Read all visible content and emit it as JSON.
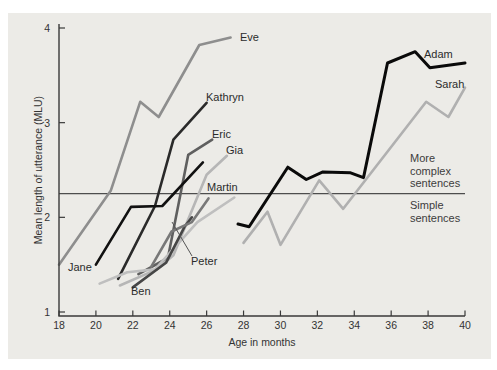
{
  "figure": {
    "panel_background": "#ecebe7",
    "axis_color": "#3a3a3a",
    "text_color": "#333333"
  },
  "chart_data": {
    "type": "line",
    "title": "",
    "xlabel": "Age in months",
    "ylabel": "Mean length of utterance (MLU)",
    "xlim": [
      18,
      40
    ],
    "ylim": [
      1,
      4
    ],
    "x_ticks": [
      18,
      20,
      22,
      24,
      26,
      28,
      30,
      32,
      34,
      36,
      38,
      40
    ],
    "y_ticks": [
      1,
      2,
      3,
      4
    ],
    "grid": false,
    "legend": "inline-labels",
    "divider": {
      "mlu": 2.25,
      "above_label": "More complex sentences",
      "below_label": "Simple sentences"
    },
    "series": [
      {
        "name": "Eve",
        "color": "#8e8e8e",
        "width": 2.6,
        "points": [
          [
            18,
            1.5
          ],
          [
            20.8,
            2.28
          ],
          [
            22.4,
            3.22
          ],
          [
            23.4,
            3.06
          ],
          [
            25.6,
            3.82
          ],
          [
            27.3,
            3.9
          ]
        ],
        "label_px": {
          "x": 240,
          "y": 31
        }
      },
      {
        "name": "Kathryn",
        "color": "#2a2a2a",
        "width": 2.6,
        "points": [
          [
            21.2,
            1.35
          ],
          [
            23.2,
            2.12
          ],
          [
            24.2,
            2.82
          ],
          [
            26,
            3.21
          ]
        ],
        "label_px": {
          "x": 206,
          "y": 91
        }
      },
      {
        "name": "Eric",
        "color": "#5f5f5f",
        "width": 2.6,
        "points": [
          [
            22.3,
            1.4
          ],
          [
            23.9,
            1.57
          ],
          [
            25,
            2.66
          ],
          [
            26.3,
            2.82
          ]
        ],
        "label_px": {
          "x": 212,
          "y": 128
        }
      },
      {
        "name": "Gia",
        "color": "#b6b6b6",
        "width": 2.6,
        "points": [
          [
            21.3,
            1.28
          ],
          [
            23.3,
            1.45
          ],
          [
            24.2,
            1.6
          ],
          [
            26,
            2.45
          ],
          [
            27.1,
            2.65
          ]
        ],
        "label_px": {
          "x": 226,
          "y": 144
        }
      },
      {
        "name": "Martin",
        "color": "#bfbfbf",
        "width": 2.6,
        "points": [
          [
            20.2,
            1.3
          ],
          [
            21.7,
            1.42
          ],
          [
            23.2,
            1.45
          ],
          [
            25.5,
            1.95
          ],
          [
            27.5,
            2.21
          ]
        ],
        "label_px": {
          "x": 207,
          "y": 181
        }
      },
      {
        "name": "Jane",
        "color": "#111111",
        "width": 2.6,
        "points": [
          [
            20,
            1.5
          ],
          [
            21.9,
            2.11
          ],
          [
            23.6,
            2.12
          ],
          [
            25.8,
            2.58
          ]
        ],
        "label_px": {
          "x": 68,
          "y": 261
        }
      },
      {
        "name": "Ben",
        "color": "#464646",
        "width": 2.6,
        "points": [
          [
            22,
            1.26
          ],
          [
            23.8,
            1.52
          ],
          [
            24.8,
            1.9
          ],
          [
            25.2,
            2.0
          ]
        ],
        "label_px": {
          "x": 131,
          "y": 285
        }
      },
      {
        "name": "Peter",
        "color": "#787878",
        "width": 2.6,
        "points": [
          [
            23,
            1.48
          ],
          [
            24.1,
            1.85
          ],
          [
            25.2,
            1.95
          ],
          [
            26.1,
            2.2
          ]
        ],
        "label_px": {
          "x": 191,
          "y": 255
        },
        "callout_px": {
          "x1": 192,
          "y1": 256,
          "x2": 172,
          "y2": 222
        }
      },
      {
        "name": "Adam",
        "color": "#0a0a0a",
        "width": 3,
        "points": [
          [
            27.7,
            1.93
          ],
          [
            28.3,
            1.9
          ],
          [
            30.4,
            2.53
          ],
          [
            31.4,
            2.4
          ],
          [
            32.3,
            2.48
          ],
          [
            33.8,
            2.47
          ],
          [
            34.5,
            2.42
          ],
          [
            35.8,
            3.63
          ],
          [
            37.3,
            3.75
          ],
          [
            38.1,
            3.58
          ],
          [
            40,
            3.63
          ]
        ],
        "label_px": {
          "x": 424,
          "y": 48
        }
      },
      {
        "name": "Sarah",
        "color": "#b0b0b0",
        "width": 2.6,
        "points": [
          [
            28,
            1.73
          ],
          [
            29.3,
            2.06
          ],
          [
            30,
            1.71
          ],
          [
            32.1,
            2.39
          ],
          [
            33.4,
            2.09
          ],
          [
            37.9,
            3.22
          ],
          [
            39.1,
            3.06
          ],
          [
            40,
            3.37
          ]
        ],
        "label_px": {
          "x": 435,
          "y": 78
        }
      }
    ]
  }
}
